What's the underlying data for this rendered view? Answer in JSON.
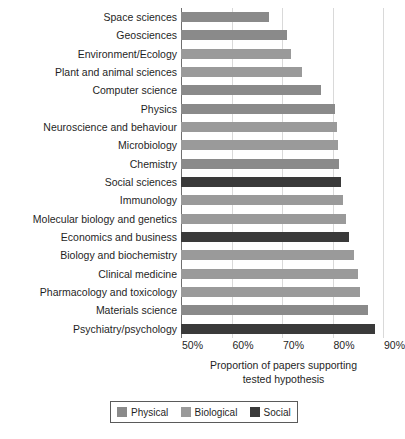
{
  "chart_data": {
    "type": "bar",
    "orientation": "horizontal",
    "title": "",
    "xlabel": "Proportion of papers supporting tested hypothesis",
    "xlabel_line1": "Proportion of papers supporting",
    "xlabel_line2": "tested hypothesis",
    "ylabel": "",
    "xlim": [
      50,
      90
    ],
    "xticks": [
      50,
      60,
      70,
      80,
      90
    ],
    "xtick_labels": [
      "50%",
      "60%",
      "70%",
      "80%",
      "90%"
    ],
    "grid": true,
    "legend_position": "bottom",
    "categories": [
      "Space sciences",
      "Geosciences",
      "Environment/Ecology",
      "Plant and animal sciences",
      "Computer science",
      "Physics",
      "Neuroscience and behaviour",
      "Microbiology",
      "Chemistry",
      "Social sciences",
      "Immunology",
      "Molecular biology and genetics",
      "Economics and business",
      "Biology and biochemistry",
      "Clinical medicine",
      "Pharmacology and toxicology",
      "Materials science",
      "Psychiatry/psychology"
    ],
    "values": [
      67.5,
      71.0,
      71.8,
      74.0,
      77.7,
      80.5,
      80.8,
      81.0,
      81.3,
      81.6,
      82.0,
      82.7,
      83.3,
      84.3,
      85.0,
      85.4,
      87.0,
      88.5
    ],
    "groups": [
      "Physical",
      "Physical",
      "Biological",
      "Biological",
      "Physical",
      "Physical",
      "Biological",
      "Biological",
      "Physical",
      "Social",
      "Biological",
      "Biological",
      "Social",
      "Biological",
      "Biological",
      "Biological",
      "Physical",
      "Social"
    ],
    "legend": [
      {
        "label": "Physical",
        "color": "#8a8a8a"
      },
      {
        "label": "Biological",
        "color": "#9a9a9a"
      },
      {
        "label": "Social",
        "color": "#3a3a3a"
      }
    ],
    "colors": {
      "physical": "#8a8a8a",
      "biological": "#9a9a9a",
      "social": "#3a3a3a",
      "grid": "#d9d9d9",
      "axis": "#6f6f6f",
      "text": "#1f1f1f",
      "background": "#ffffff"
    }
  }
}
